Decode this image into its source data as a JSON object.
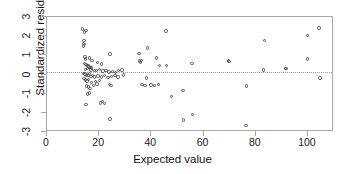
{
  "chart_data": {
    "type": "scatter",
    "title": "",
    "xlabel": "Expected value",
    "ylabel": "Standardized residual",
    "xlim": [
      0,
      110
    ],
    "ylim": [
      -3,
      3
    ],
    "xticks": [
      0,
      20,
      40,
      60,
      80,
      100
    ],
    "yticks": [
      3,
      2,
      1,
      0,
      -1,
      -2,
      -3
    ],
    "xtick_labels": [
      "0",
      "20",
      "40",
      "60",
      "80",
      "100"
    ],
    "ytick_labels": [
      "3",
      "2",
      "1",
      "0",
      "-1",
      "-2",
      "-3"
    ],
    "grid": false,
    "legend": null,
    "marker": "open-circle",
    "marker_color": "#4a4a4a",
    "reference_line": {
      "type": "horizontal",
      "y": 0.15,
      "style": "dotted",
      "color": "#9a9a9a"
    },
    "frame": "box",
    "points": [
      [
        13.6,
        2.38
      ],
      [
        14.3,
        2.22
      ],
      [
        15.0,
        2.3
      ],
      [
        14.2,
        1.78
      ],
      [
        14.0,
        1.62
      ],
      [
        14.4,
        1.55
      ],
      [
        14.1,
        1.48
      ],
      [
        14.6,
        0.92
      ],
      [
        14.8,
        0.8
      ],
      [
        16.4,
        0.86
      ],
      [
        17.2,
        0.72
      ],
      [
        19.3,
        0.62
      ],
      [
        20.8,
        0.55
      ],
      [
        14.3,
        0.58
      ],
      [
        14.9,
        0.52
      ],
      [
        15.3,
        0.46
      ],
      [
        15.8,
        0.44
      ],
      [
        16.1,
        0.4
      ],
      [
        16.7,
        0.36
      ],
      [
        17.1,
        0.34
      ],
      [
        15.5,
        0.3
      ],
      [
        14.7,
        0.26
      ],
      [
        16.9,
        0.24
      ],
      [
        18.1,
        0.22
      ],
      [
        19.0,
        0.2
      ],
      [
        20.2,
        0.26
      ],
      [
        21.4,
        0.18
      ],
      [
        22.6,
        0.22
      ],
      [
        23.8,
        0.14
      ],
      [
        25.1,
        0.16
      ],
      [
        26.3,
        0.12
      ],
      [
        27.5,
        0.2
      ],
      [
        28.8,
        0.24
      ],
      [
        14.1,
        0.06
      ],
      [
        14.5,
        0.02
      ],
      [
        15.1,
        -0.02
      ],
      [
        15.7,
        -0.06
      ],
      [
        16.2,
        0.04
      ],
      [
        16.8,
        -0.1
      ],
      [
        17.5,
        -0.04
      ],
      [
        18.3,
        -0.14
      ],
      [
        19.6,
        -0.08
      ],
      [
        20.9,
        -0.12
      ],
      [
        22.1,
        -0.06
      ],
      [
        23.4,
        -0.16
      ],
      [
        24.7,
        -0.1
      ],
      [
        26.0,
        -0.04
      ],
      [
        27.2,
        -0.12
      ],
      [
        29.4,
        -0.02
      ],
      [
        14.2,
        -0.22
      ],
      [
        14.8,
        -0.28
      ],
      [
        15.4,
        -0.34
      ],
      [
        16.0,
        -0.26
      ],
      [
        17.0,
        -0.42
      ],
      [
        18.6,
        -0.36
      ],
      [
        20.1,
        -0.3
      ],
      [
        15.2,
        -0.6
      ],
      [
        15.9,
        -0.66
      ],
      [
        16.5,
        -0.72
      ],
      [
        17.8,
        -0.56
      ],
      [
        19.2,
        -0.5
      ],
      [
        23.9,
        -0.52
      ],
      [
        24.6,
        -0.58
      ],
      [
        15.6,
        -1.02
      ],
      [
        16.3,
        -0.96
      ],
      [
        14.9,
        -1.58
      ],
      [
        20.4,
        -1.48
      ],
      [
        21.3,
        -1.42
      ],
      [
        22.0,
        -1.52
      ],
      [
        24.2,
        -2.32
      ],
      [
        24.1,
        1.06
      ],
      [
        35.2,
        1.1
      ],
      [
        38.6,
        1.38
      ],
      [
        35.4,
        0.7
      ],
      [
        35.8,
        0.66
      ],
      [
        36.3,
        0.74
      ],
      [
        41.9,
        0.86
      ],
      [
        43.2,
        0.48
      ],
      [
        45.6,
        2.28
      ],
      [
        45.9,
        0.48
      ],
      [
        38.1,
        -0.18
      ],
      [
        36.4,
        -0.52
      ],
      [
        37.6,
        -0.58
      ],
      [
        39.8,
        -0.54
      ],
      [
        41.1,
        -0.56
      ],
      [
        42.7,
        -0.52
      ],
      [
        47.8,
        -1.14
      ],
      [
        52.1,
        -0.84
      ],
      [
        52.4,
        -2.38
      ],
      [
        55.8,
        -2.08
      ],
      [
        55.6,
        0.56
      ],
      [
        69.6,
        0.74
      ],
      [
        69.8,
        0.68
      ],
      [
        76.4,
        -0.6
      ],
      [
        76.2,
        -2.66
      ],
      [
        83.4,
        1.78
      ],
      [
        83.0,
        0.24
      ],
      [
        91.4,
        0.32
      ],
      [
        91.6,
        0.3
      ],
      [
        99.8,
        2.02
      ],
      [
        99.9,
        0.8
      ],
      [
        104.2,
        2.42
      ],
      [
        104.6,
        -0.18
      ]
    ]
  }
}
